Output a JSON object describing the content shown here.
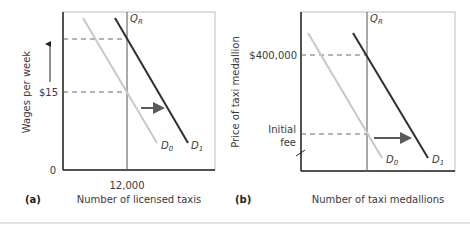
{
  "figure": {
    "divider_color": "#d8d8d8"
  },
  "colors": {
    "axis": "#222222",
    "frame": "#bdbdbd",
    "qr_line": "#555555",
    "d0_curve": "#c8c8c8",
    "d1_curve": "#2e2e2e",
    "dashed": "#6a6a6a",
    "shift_arrow": "#5a5a5a"
  },
  "panel_a": {
    "tag": "(a)",
    "y_axis_label": "Wages per week",
    "x_axis_label": "Number of licensed taxis",
    "origin_label": "0",
    "y_tick_label": "$15",
    "x_tick_label": "12,000",
    "quota_label": "Q",
    "quota_sub": "R",
    "d0_label": "D",
    "d0_sub": "0",
    "d1_label": "D",
    "d1_sub": "1"
  },
  "panel_b": {
    "tag": "(b)",
    "y_axis_label": "Price of taxi medallion",
    "x_axis_label": "Number of taxi medallions",
    "y_tick_high": "$400,000",
    "y_tick_low_line1": "Initial",
    "y_tick_low_line2": "fee",
    "quota_label": "Q",
    "quota_sub": "R",
    "d0_label": "D",
    "d0_sub": "0",
    "d1_label": "D",
    "d1_sub": "1"
  }
}
